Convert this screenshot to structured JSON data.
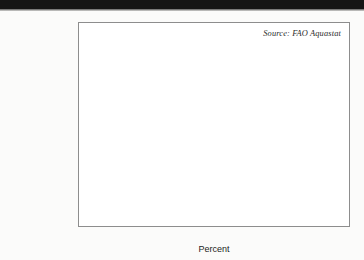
{
  "figure": {
    "source_note": "Source: FAO Aquastat",
    "xaxis_title": "Percent",
    "tick_labels": [
      "0",
      "10",
      "20",
      "30",
      "40"
    ],
    "category_labels": [
      "Sub-Saharan\nAfrica",
      "Europe",
      "North America",
      "Latin America\nand Carribean",
      "Middle East",
      "Southern and\nEastern Asia",
      "World"
    ]
  },
  "chart_data": {
    "type": "bar",
    "orientation": "horizontal",
    "title": "",
    "subtitle": "",
    "xlabel": "Percent",
    "ylabel": "",
    "xlim": [
      0,
      40
    ],
    "xticks": [
      0,
      10,
      20,
      30,
      40
    ],
    "grid": false,
    "legend": false,
    "annotations": [
      "Source: FAO Aquastat"
    ],
    "categories": [
      "Sub-Saharan Africa",
      "Europe",
      "North America",
      "Latin America and Carribean",
      "Middle East",
      "Southern and Eastern Asia",
      "World"
    ],
    "values": [
      4.8,
      11.6,
      12.1,
      13.8,
      35.7,
      36.8,
      18.0
    ],
    "colors": [
      "#111111",
      "#f4f4f4",
      "#d2d2d2",
      "#3d3d3d",
      "#858585",
      "#bfbfbf",
      "#333333"
    ]
  }
}
